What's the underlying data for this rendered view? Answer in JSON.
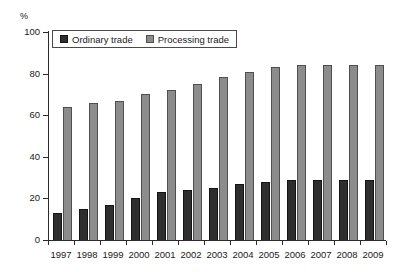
{
  "chart_data": {
    "type": "bar",
    "title": "",
    "subtitle": "",
    "xlabel": "",
    "ylabel": "%",
    "unit_label": "%",
    "categories": [
      "1997",
      "1998",
      "1999",
      "2000",
      "2001",
      "2002",
      "2003",
      "2004",
      "2005",
      "2006",
      "2007",
      "2008",
      "2009"
    ],
    "series": [
      {
        "name": "Ordinary trade",
        "color": "#2e2e2e",
        "values": [
          13,
          15,
          17,
          20,
          23,
          24,
          25,
          27,
          28,
          29,
          29,
          29,
          29
        ]
      },
      {
        "name": "Processing trade",
        "color": "#8c8c8c",
        "values": [
          64,
          66,
          67,
          70,
          72,
          75,
          78.5,
          81,
          83,
          84,
          84,
          84,
          84
        ]
      }
    ],
    "ylim": [
      0,
      100
    ],
    "yticks": [
      0,
      20,
      40,
      60,
      80,
      100
    ],
    "ytick_labels": [
      "0",
      "20",
      "40",
      "60",
      "80",
      "100"
    ],
    "grid": false,
    "legend_position": "top-left",
    "legend": [
      "Ordinary trade",
      "Processing trade"
    ]
  },
  "legend": {
    "entries": [
      {
        "label": "Ordinary trade",
        "swatch": "ordinary-swatch-icon"
      },
      {
        "label": "Processing trade",
        "swatch": "processing-swatch-icon"
      }
    ]
  }
}
